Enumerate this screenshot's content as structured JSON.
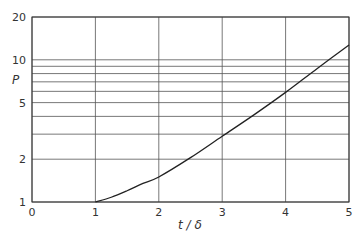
{
  "chart_data": {
    "type": "line",
    "title": "",
    "xlabel": "t / δ",
    "ylabel": "P",
    "xlim": [
      0,
      5
    ],
    "ylim": [
      1,
      20
    ],
    "yscale": "log",
    "grid": true,
    "x_ticks": [
      "0",
      "1",
      "2",
      "3",
      "4",
      "5"
    ],
    "y_tick_labels": [
      "1",
      "2",
      "5",
      "10",
      "20"
    ],
    "y_gridlines": [
      1,
      2,
      3,
      4,
      5,
      6,
      7,
      8,
      9,
      10,
      20
    ],
    "series": [
      {
        "name": "P(t/δ)",
        "x": [
          1.0,
          1.25,
          1.5,
          1.75,
          2.0,
          2.5,
          3.0,
          3.5,
          4.0,
          4.5,
          5.0
        ],
        "y": [
          1.0,
          1.08,
          1.2,
          1.35,
          1.5,
          2.05,
          2.9,
          4.1,
          5.9,
          8.7,
          12.7
        ]
      }
    ]
  }
}
